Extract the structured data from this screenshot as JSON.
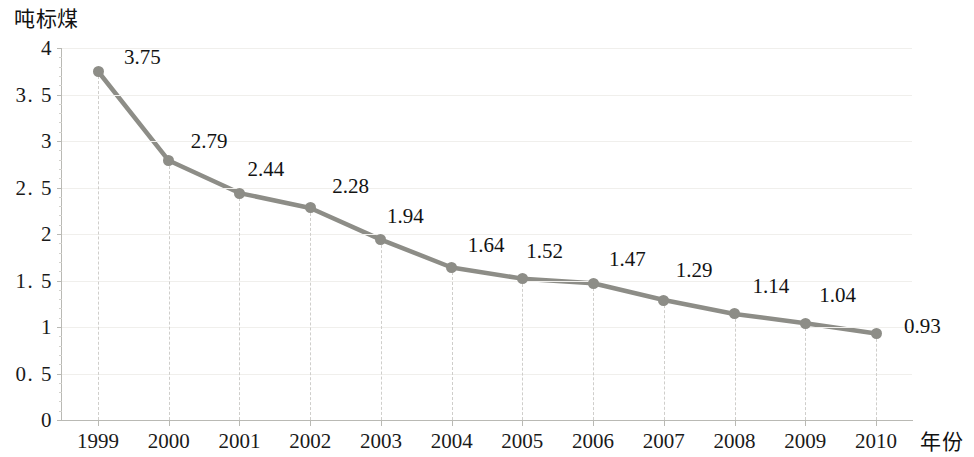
{
  "chart_data": {
    "type": "line",
    "title": "",
    "subtitle": "",
    "xlabel": "年份",
    "ylabel": "吨标煤",
    "categories": [
      "1999",
      "2000",
      "2001",
      "2002",
      "2003",
      "2004",
      "2005",
      "2006",
      "2007",
      "2008",
      "2009",
      "2010"
    ],
    "values": [
      3.75,
      2.79,
      2.44,
      2.28,
      1.94,
      1.64,
      1.52,
      1.47,
      1.29,
      1.14,
      1.04,
      0.93
    ],
    "point_labels": [
      "3.75",
      "2.79",
      "2.44",
      "2.28",
      "1.94",
      "1.64",
      "1.52",
      "1.47",
      "1.29",
      "1.14",
      "1.04",
      "0.93"
    ],
    "series": [
      {
        "name": "",
        "values": [
          3.75,
          2.79,
          2.44,
          2.28,
          1.94,
          1.64,
          1.52,
          1.47,
          1.29,
          1.14,
          1.04,
          0.93
        ]
      }
    ],
    "ylim": [
      0,
      4
    ],
    "ytick_labels": [
      "4",
      "3. 5",
      "3",
      "2. 5",
      "2",
      "1. 5",
      "1",
      "0. 5",
      "0"
    ],
    "ytick_values": [
      4,
      3.5,
      3,
      2.5,
      2,
      1.5,
      1,
      0.5,
      0
    ],
    "grid": "horizontal",
    "droplines": true,
    "legend": "none",
    "line_color": "#8d8d87",
    "marker_color": "#8d8d87",
    "gridline_color": "#f0efec",
    "axis_color": "#b9b9b4",
    "background_color": "#ffffff"
  }
}
